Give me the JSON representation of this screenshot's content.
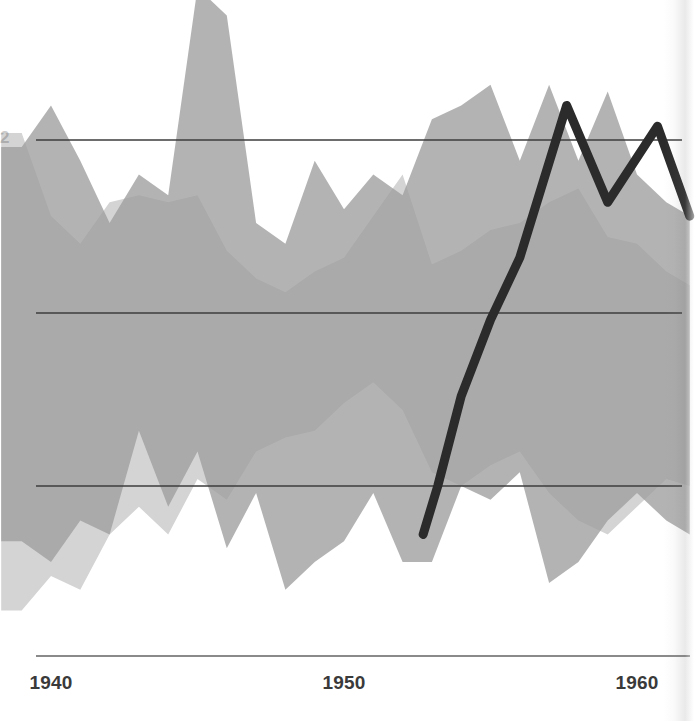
{
  "chart_data": {
    "type": "area",
    "title": "",
    "subtitle": "",
    "xlabel": "",
    "ylabel": "",
    "grid": true,
    "legend": false,
    "legend_position": "none",
    "xlim": [
      1938.3,
      1961.8
    ],
    "ylim": [
      0,
      100
    ],
    "x_tick_labels": [
      "1940",
      "1950",
      "1960"
    ],
    "x_tick_values": [
      1940,
      1950,
      1960
    ],
    "y_gridline_values": [
      75,
      50,
      25
    ],
    "y_tick_labels": [],
    "colors": {
      "band_dark": "#a9a9a9",
      "band_light": "#d4d4d4",
      "line": "#2b2b2b",
      "gridline": "#3c3c3c",
      "axis": "#8a8a8a",
      "background": "#ffffff",
      "tick_label": "#3a3a3a"
    },
    "series": [
      {
        "name": "band-a",
        "type": "range-band",
        "fill": "#a9a9a9",
        "x": [
          1938.3,
          1939.0,
          1940.0,
          1941.0,
          1942.0,
          1943.0,
          1944.0,
          1945.0,
          1946.0,
          1947.0,
          1948.0,
          1949.0,
          1950.0,
          1951.0,
          1952.0,
          1953.0,
          1954.0,
          1955.0,
          1956.0,
          1957.0,
          1958.0,
          1959.0,
          1960.0,
          1961.0,
          1961.8
        ],
        "upper": [
          74,
          74,
          80,
          72,
          63,
          70,
          67,
          97,
          93,
          63,
          60,
          72,
          65,
          70,
          67,
          78,
          80,
          83,
          72,
          83,
          72,
          82,
          70,
          66,
          64
        ],
        "lower": [
          17,
          17,
          14,
          20,
          18,
          33,
          22,
          30,
          16,
          24,
          10,
          14,
          17,
          24,
          14,
          14,
          25,
          23,
          27,
          11,
          14,
          20,
          24,
          20,
          18
        ]
      },
      {
        "name": "band-b",
        "type": "range-band",
        "fill": "#d4d4d4",
        "x": [
          1938.3,
          1939.0,
          1940.0,
          1941.0,
          1942.0,
          1943.0,
          1944.0,
          1945.0,
          1946.0,
          1947.0,
          1948.0,
          1949.0,
          1950.0,
          1951.0,
          1952.0,
          1953.0,
          1954.0,
          1955.0,
          1956.0,
          1957.0,
          1958.0,
          1959.0,
          1960.0,
          1961.0,
          1961.8
        ],
        "upper": [
          76,
          76,
          64,
          60,
          66,
          67,
          66,
          67,
          59,
          55,
          53,
          56,
          58,
          64,
          70,
          57,
          59,
          62,
          63,
          66,
          68,
          61,
          60,
          56,
          54
        ],
        "lower": [
          7,
          7,
          12,
          10,
          18,
          22,
          18,
          26,
          23,
          30,
          32,
          33,
          37,
          40,
          36,
          27,
          25,
          28,
          30,
          24,
          20,
          18,
          22,
          26,
          25
        ]
      },
      {
        "name": "trend-line",
        "type": "line",
        "stroke": "#2b2b2b",
        "stroke_width": 9,
        "x": [
          1952.7,
          1953.2,
          1954.0,
          1955.0,
          1956.0,
          1957.6,
          1959.0,
          1960.7,
          1961.8
        ],
        "y": [
          18,
          25,
          38,
          49,
          58,
          80,
          66,
          77,
          64
        ]
      }
    ],
    "annotations": []
  },
  "axis": {
    "ticks": [
      {
        "label": "1940",
        "x_px": 51
      },
      {
        "label": "1950",
        "x_px": 344
      },
      {
        "label": "1960",
        "x_px": 637
      }
    ]
  },
  "left_cut_label": "25"
}
